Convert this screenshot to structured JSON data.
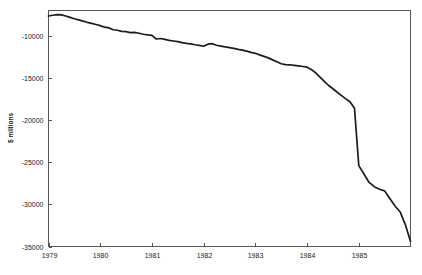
{
  "chart_data": {
    "type": "line",
    "title": "",
    "subtitle": "",
    "xlabel": "",
    "ylabel": "$ millions",
    "xlim": [
      1979.0,
      1986.0
    ],
    "ylim": [
      -35000,
      -7000
    ],
    "grid": false,
    "legend": null,
    "x_tick_labels": [
      "1979",
      "1980",
      "1981",
      "1982",
      "1983",
      "1984",
      "1985"
    ],
    "x_ticks": [
      1979,
      1980,
      1981,
      1982,
      1983,
      1984,
      1985
    ],
    "y_tick_labels": [
      "-10000",
      "-15000",
      "-20000",
      "-25000",
      "-30000",
      "-35000"
    ],
    "y_ticks": [
      -10000,
      -15000,
      -20000,
      -25000,
      -30000,
      -35000
    ],
    "line_color": "#1c1c1c",
    "series": [
      {
        "name": "balance",
        "x": [
          1979.0,
          1979.083,
          1979.167,
          1979.25,
          1979.333,
          1979.417,
          1979.5,
          1979.583,
          1979.667,
          1979.75,
          1979.833,
          1979.917,
          1980.0,
          1980.083,
          1980.167,
          1980.25,
          1980.333,
          1980.417,
          1980.5,
          1980.583,
          1980.667,
          1980.75,
          1980.833,
          1980.917,
          1981.0,
          1981.083,
          1981.167,
          1981.25,
          1981.333,
          1981.417,
          1981.5,
          1981.583,
          1981.667,
          1981.75,
          1981.833,
          1981.917,
          1982.0,
          1982.083,
          1982.167,
          1982.25,
          1982.333,
          1982.417,
          1982.5,
          1982.583,
          1982.667,
          1982.75,
          1982.833,
          1982.917,
          1983.0,
          1983.083,
          1983.167,
          1983.25,
          1983.333,
          1983.417,
          1983.5,
          1983.583,
          1983.667,
          1983.75,
          1983.833,
          1983.917,
          1984.0,
          1984.083,
          1984.167,
          1984.25,
          1984.333,
          1984.417,
          1984.5,
          1984.583,
          1984.667,
          1984.75,
          1984.833,
          1984.917,
          1985.0,
          1985.083,
          1985.167,
          1985.25,
          1985.333,
          1985.417,
          1985.5,
          1985.583,
          1985.667,
          1985.75,
          1985.833,
          1985.917,
          1986.0
        ],
        "values": [
          -7650,
          -7560,
          -7480,
          -7520,
          -7650,
          -7820,
          -7980,
          -8120,
          -8260,
          -8400,
          -8520,
          -8660,
          -8800,
          -8980,
          -9060,
          -9280,
          -9340,
          -9480,
          -9500,
          -9620,
          -9600,
          -9700,
          -9820,
          -9900,
          -9960,
          -10380,
          -10320,
          -10420,
          -10540,
          -10620,
          -10700,
          -10820,
          -10900,
          -10960,
          -11060,
          -11140,
          -11240,
          -11000,
          -10940,
          -11120,
          -11220,
          -11320,
          -11400,
          -11500,
          -11620,
          -11700,
          -11820,
          -11960,
          -12080,
          -12260,
          -12440,
          -12620,
          -12860,
          -13080,
          -13320,
          -13420,
          -13440,
          -13500,
          -13560,
          -13640,
          -13720,
          -14000,
          -14400,
          -14900,
          -15400,
          -15900,
          -16280,
          -16700,
          -17100,
          -17480,
          -17860,
          -18600,
          -19400,
          -20200,
          -21000,
          -21700,
          -22400,
          -23100,
          -23800,
          -24500,
          -25200,
          -25600,
          -26200,
          -26800,
          -27400
        ]
      }
    ],
    "series_extension": {
      "note_visible": false,
      "x_tail": [
        1985.0,
        1985.1,
        1985.2,
        1985.3,
        1985.4,
        1985.5,
        1985.6,
        1985.7,
        1985.8,
        1985.9,
        1986.0
      ],
      "values_tail": [
        -25400,
        -26400,
        -27400,
        -27900,
        -28200,
        -28400,
        -29300,
        -30200,
        -30900,
        -32400,
        -34400
      ]
    }
  }
}
